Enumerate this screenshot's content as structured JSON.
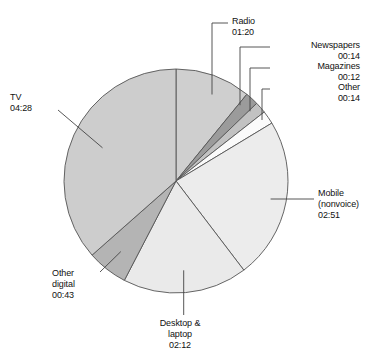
{
  "chart_data": {
    "type": "pie",
    "title": "",
    "subtitle": "",
    "xlabel": "",
    "ylabel": "",
    "legend_position": "none",
    "grid": false,
    "value_format": "hh:mm",
    "total": "12:14",
    "start_angle_deg": 0,
    "direction": "clockwise",
    "categories": [
      "Radio",
      "Newspapers",
      "Magazines",
      "Other",
      "Mobile (nonvoice)",
      "Desktop & laptop",
      "Other digital",
      "TV"
    ],
    "values": [
      80,
      14,
      12,
      14,
      171,
      132,
      43,
      268
    ],
    "value_labels": [
      "01:20",
      "00:14",
      "00:12",
      "00:14",
      "02:51",
      "02:12",
      "00:43",
      "04:28"
    ],
    "slices": [
      {
        "name": "Radio",
        "label": "Radio",
        "value_label": "01:20",
        "minutes": 80,
        "color": "#cfcfcf"
      },
      {
        "name": "Newspapers",
        "label": "Newspapers",
        "value_label": "00:14",
        "minutes": 14,
        "color": "#9b9b9b"
      },
      {
        "name": "Magazines",
        "label": "Magazines",
        "value_label": "00:12",
        "minutes": 12,
        "color": "#c2c2c2"
      },
      {
        "name": "Other",
        "label": "Other",
        "value_label": "00:14",
        "minutes": 14,
        "color": "#fbfbfb"
      },
      {
        "name": "Mobile (nonvoice)",
        "label": "Mobile",
        "label_line2": "(nonvoice)",
        "value_label": "02:51",
        "minutes": 171,
        "color": "#ececec"
      },
      {
        "name": "Desktop & laptop",
        "label": "Desktop &",
        "label_line2": "laptop",
        "value_label": "02:12",
        "minutes": 132,
        "color": "#eaeaea"
      },
      {
        "name": "Other digital",
        "label": "Other",
        "label_line2": "digital",
        "value_label": "00:43",
        "minutes": 43,
        "color": "#b4b4b4"
      },
      {
        "name": "TV",
        "label": "TV",
        "value_label": "04:28",
        "minutes": 268,
        "color": "#cdcdcd"
      }
    ]
  },
  "labels": {
    "tv": {
      "line1": "TV",
      "line2": "04:28"
    },
    "radio": {
      "line1": "Radio",
      "line2": "01:20"
    },
    "newspapers": {
      "line1": "Newspapers",
      "line2": "00:14"
    },
    "magazines": {
      "line1": "Magazines",
      "line2": "00:12"
    },
    "other": {
      "line1": "Other",
      "line2": "00:14"
    },
    "mobile": {
      "line1": "Mobile",
      "line2": "(nonvoice)",
      "line3": "02:51"
    },
    "other_digital": {
      "line1": "Other",
      "line2": "digital",
      "line3": "00:43"
    },
    "desktop": {
      "line1": "Desktop &",
      "line2": "laptop",
      "line3": "02:12"
    }
  },
  "geometry": {
    "cx": 176,
    "cy": 181,
    "r": 112,
    "stroke": "#555555",
    "leader_stroke": "#444444"
  }
}
